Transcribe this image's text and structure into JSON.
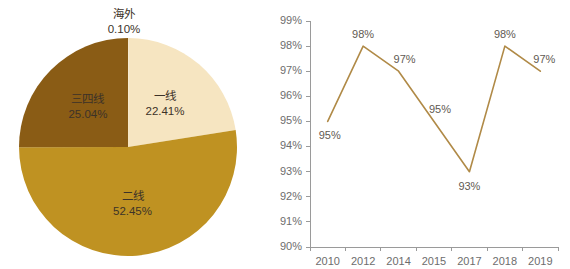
{
  "chart_data": [
    {
      "type": "pie",
      "title": "",
      "id": "city-tier-distribution",
      "categories": [
        "海外",
        "一线",
        "二线",
        "三四线"
      ],
      "values": [
        0.1,
        22.41,
        52.45,
        25.04
      ],
      "value_labels": [
        "0.10%",
        "22.41%",
        "52.45%",
        "25.04%"
      ],
      "slices": [
        {
          "name": "海外",
          "value": 0.1,
          "value_label": "0.10%",
          "color": "#efe0bd",
          "label_position": "outside-top",
          "label_fill": "#3c3228"
        },
        {
          "name": "一线",
          "value": 22.41,
          "value_label": "22.41%",
          "color": "#f6e5c1",
          "label_position": "inside",
          "label_fill": "#3c3228"
        },
        {
          "name": "二线",
          "value": 52.45,
          "value_label": "52.45%",
          "color": "#bf9222",
          "label_position": "inside",
          "label_fill": "#3c3228"
        },
        {
          "name": "三四线",
          "value": 25.04,
          "value_label": "25.04%",
          "color": "#8a5c15",
          "label_position": "inside",
          "label_fill": "#f3ead9"
        }
      ],
      "start_angle": 0,
      "direction": "clockwise",
      "legend": "none",
      "xlabel": "",
      "ylabel": ""
    },
    {
      "type": "line",
      "id": "rate-trend",
      "title": "",
      "x": [
        "2010",
        "2012",
        "2014",
        "2015",
        "2017",
        "2018",
        "2019"
      ],
      "categories": [
        "2010",
        "2012",
        "2014",
        "2015",
        "2017",
        "2018",
        "2019"
      ],
      "values": [
        95,
        98,
        97,
        95,
        93,
        98,
        97
      ],
      "point_labels": [
        "95%",
        "98%",
        "97%",
        "95%",
        "93%",
        "98%",
        "97%"
      ],
      "series": [
        {
          "name": "",
          "color": "#b08a47",
          "values": [
            95,
            98,
            97,
            95,
            93,
            98,
            97
          ]
        }
      ],
      "ylim": [
        90,
        99
      ],
      "ytick_values": [
        90,
        91,
        92,
        93,
        94,
        95,
        96,
        97,
        98,
        99
      ],
      "ytick_labels": [
        "90%",
        "91%",
        "92%",
        "93%",
        "94%",
        "95%",
        "96%",
        "97%",
        "98%",
        "99%"
      ],
      "xtick_labels": [
        "2010",
        "2012",
        "2014",
        "2015",
        "2017",
        "2018",
        "2019"
      ],
      "grid": false,
      "legend": "none",
      "xlabel": "",
      "ylabel": "",
      "axis_color": "#9a9a9a",
      "tick_text_color": "#6d6d6d",
      "label_text_color": "#5f5a52"
    }
  ],
  "colors": {
    "background": "#ffffff",
    "pie_tier1": "#f6e5c1",
    "pie_tier2": "#bf9222",
    "pie_tier34": "#8a5c15",
    "pie_overseas": "#efe0bd",
    "line_stroke": "#b08a47",
    "axis": "#9a9a9a"
  }
}
